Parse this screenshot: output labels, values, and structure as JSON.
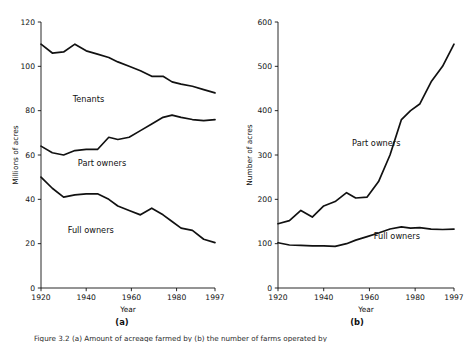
{
  "figure": {
    "panel_a_letter": "(a)",
    "panel_b_letter": "(b)",
    "caption": "Figure 3.2 (a) Amount of acreage farmed by (b) the number of farms operated by"
  },
  "chart_data": [
    {
      "id": "panel_a",
      "type": "line",
      "title": "",
      "xlabel": "Year",
      "ylabel": "Millions of acres",
      "xlim": [
        1920,
        1997
      ],
      "ylim": [
        0,
        120
      ],
      "xticks": [
        1920,
        1940,
        1960,
        1980,
        1997
      ],
      "xticklabels": [
        "1920",
        "1940",
        "1960",
        "1980",
        "1997"
      ],
      "yticks": [
        0,
        20,
        40,
        60,
        80,
        100,
        120
      ],
      "yticklabels": [
        "0",
        "20",
        "40",
        "60",
        "80",
        "100",
        "120"
      ],
      "grid": false,
      "legend": "inline-annotations",
      "annotations": [
        {
          "text": "Tenants",
          "x": 1941,
          "y": 84
        },
        {
          "text": "Part owners",
          "x": 1947,
          "y": 55
        },
        {
          "text": "Full owners",
          "x": 1942,
          "y": 25
        }
      ],
      "series": [
        {
          "name": "Tenants",
          "x": [
            1920,
            1925,
            1930,
            1935,
            1940,
            1945,
            1950,
            1954,
            1959,
            1964,
            1969,
            1974,
            1978,
            1982,
            1987,
            1992,
            1997
          ],
          "values": [
            110,
            106,
            106.5,
            110,
            107,
            105.5,
            104,
            102,
            100,
            98,
            95.5,
            95.5,
            93,
            92,
            91,
            89.5,
            88
          ]
        },
        {
          "name": "Part owners",
          "x": [
            1920,
            1925,
            1930,
            1935,
            1940,
            1945,
            1950,
            1954,
            1959,
            1964,
            1969,
            1974,
            1978,
            1982,
            1987,
            1992,
            1997
          ],
          "values": [
            64,
            61,
            60,
            62,
            62.5,
            62.5,
            68,
            67,
            68,
            71,
            74,
            77,
            78,
            77,
            76,
            75.5,
            76
          ]
        },
        {
          "name": "Full owners",
          "x": [
            1920,
            1925,
            1930,
            1935,
            1940,
            1945,
            1950,
            1954,
            1959,
            1964,
            1969,
            1974,
            1978,
            1982,
            1987,
            1992,
            1997
          ],
          "values": [
            50,
            45,
            41,
            42,
            42.5,
            42.5,
            40,
            37,
            35,
            33,
            36,
            33,
            30,
            27,
            26,
            22,
            20.5
          ]
        }
      ]
    },
    {
      "id": "panel_b",
      "type": "line",
      "title": "",
      "xlabel": "Year",
      "ylabel": "Number of acres",
      "xlim": [
        1920,
        1997
      ],
      "ylim": [
        0,
        600
      ],
      "xticks": [
        1920,
        1940,
        1960,
        1980,
        1997
      ],
      "xticklabels": [
        "1920",
        "1940",
        "1960",
        "1980",
        "1997"
      ],
      "yticks": [
        0,
        100,
        200,
        300,
        400,
        500,
        600
      ],
      "yticklabels": [
        "0",
        "100",
        "200",
        "300",
        "400",
        "500",
        "600"
      ],
      "grid": false,
      "legend": "inline-annotations",
      "annotations": [
        {
          "text": "Part owners",
          "x": 1963,
          "y": 320
        },
        {
          "text": "Full owners",
          "x": 1972,
          "y": 110
        }
      ],
      "series": [
        {
          "name": "Part owners",
          "x": [
            1920,
            1925,
            1930,
            1935,
            1940,
            1945,
            1950,
            1954,
            1959,
            1964,
            1969,
            1974,
            1978,
            1982,
            1987,
            1992,
            1997
          ],
          "values": [
            145,
            152,
            175,
            160,
            185,
            195,
            215,
            203,
            205,
            240,
            300,
            380,
            400,
            415,
            465,
            500,
            550
          ]
        },
        {
          "name": "Full owners",
          "x": [
            1920,
            1925,
            1930,
            1935,
            1940,
            1945,
            1950,
            1954,
            1959,
            1964,
            1969,
            1974,
            1978,
            1982,
            1987,
            1992,
            1997
          ],
          "values": [
            102,
            97,
            96,
            95,
            95,
            94,
            100,
            108,
            116,
            124,
            133,
            138,
            135,
            136,
            133,
            132,
            133
          ]
        }
      ]
    }
  ]
}
